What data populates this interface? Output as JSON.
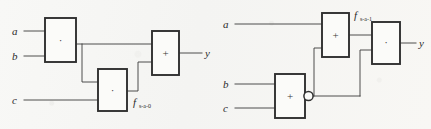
{
  "figure": {
    "background_color": "#f7f7f5",
    "ink_color": "#2b2b2b",
    "diagrams": [
      {
        "id": "left-circuit",
        "name": "stuck-at-0-circuit",
        "fault_label": {
          "symbol": "f",
          "subscript": "s-a-0"
        },
        "inputs": [
          {
            "name": "input-a",
            "label": "a"
          },
          {
            "name": "input-b",
            "label": "b"
          },
          {
            "name": "input-c",
            "label": "c"
          }
        ],
        "output": {
          "name": "output-y",
          "label": "y"
        },
        "gates": [
          {
            "name": "and-gate-ab",
            "op": "·",
            "type": "AND"
          },
          {
            "name": "and-gate-c",
            "op": "·",
            "type": "AND"
          },
          {
            "name": "or-gate-out",
            "op": "+",
            "type": "OR"
          }
        ]
      },
      {
        "id": "right-circuit",
        "name": "stuck-at-1-circuit",
        "fault_label": {
          "symbol": "f",
          "subscript": "s-a-1"
        },
        "inputs": [
          {
            "name": "input-a",
            "label": "a"
          },
          {
            "name": "input-b",
            "label": "b"
          },
          {
            "name": "input-c",
            "label": "c"
          }
        ],
        "output": {
          "name": "output-y",
          "label": "y"
        },
        "gates": [
          {
            "name": "or-gate-a",
            "op": "+",
            "type": "OR"
          },
          {
            "name": "nor-gate-bc",
            "op": "+",
            "type": "NOR",
            "inverted": true
          },
          {
            "name": "and-gate-out",
            "op": "·",
            "type": "AND"
          }
        ]
      }
    ]
  }
}
